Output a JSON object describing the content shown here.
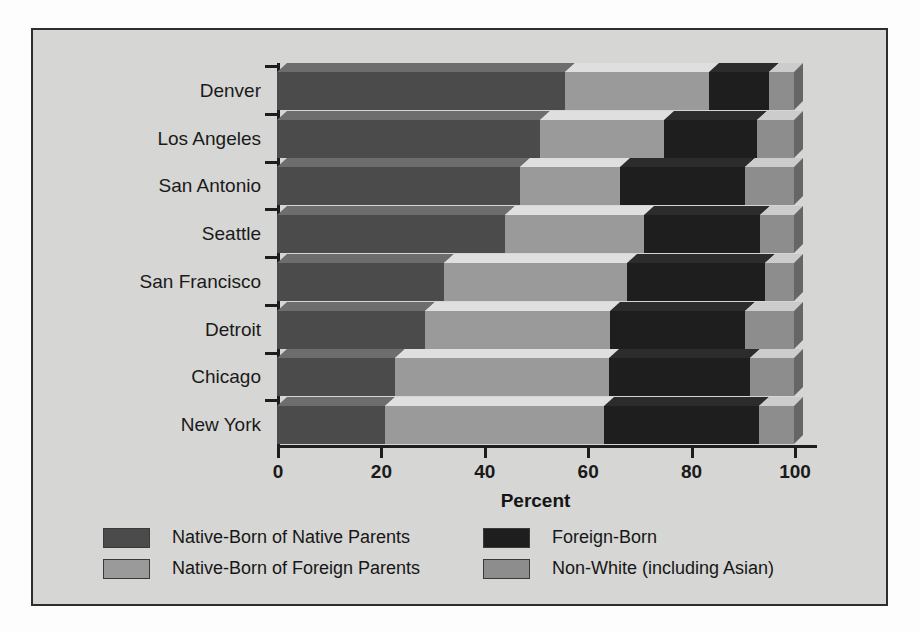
{
  "chart_data": {
    "type": "bar",
    "orientation": "horizontal",
    "stacked": true,
    "title": "",
    "xlabel": "Percent",
    "ylabel": "",
    "xlim": [
      0,
      100
    ],
    "xticks": [
      0,
      20,
      40,
      60,
      80,
      100
    ],
    "xtick_labels": [
      "0",
      "20",
      "40",
      "60",
      "80",
      "100"
    ],
    "grid": false,
    "legend_position": "bottom",
    "categories": [
      "Denver",
      "Los Angeles",
      "San Antonio",
      "Seattle",
      "San Francisco",
      "Detroit",
      "Chicago",
      "New York"
    ],
    "series": [
      {
        "name": "Native-Born of Native Parents",
        "color": "#4b4b4b",
        "values": [
          55.7,
          50.9,
          47.0,
          44.1,
          32.3,
          28.6,
          22.9,
          20.9
        ]
      },
      {
        "name": "Native-Born of Foreign Parents",
        "color": "#9a9a9a",
        "values": [
          27.9,
          23.9,
          19.3,
          26.9,
          35.4,
          35.8,
          41.3,
          42.3
        ]
      },
      {
        "name": "Foreign-Born",
        "color": "#1e1e1e",
        "values": [
          11.6,
          18.0,
          24.2,
          22.4,
          26.7,
          26.1,
          27.3,
          30.0
        ]
      },
      {
        "name": "Non-White (including Asian)",
        "color": "#8d8d8d",
        "values": [
          4.8,
          7.2,
          9.5,
          6.6,
          5.6,
          9.5,
          8.5,
          6.8
        ]
      }
    ]
  },
  "axis": {
    "x_title": "Percent"
  },
  "legend": {
    "items": [
      {
        "label": "Native-Born of Native Parents",
        "color": "#4b4b4b"
      },
      {
        "label": "Foreign-Born",
        "color": "#1e1e1e"
      },
      {
        "label": "Native-Born of Foreign Parents",
        "color": "#9a9a9a"
      },
      {
        "label": "Non-White (including Asian)",
        "color": "#8d8d8d"
      }
    ]
  },
  "style": {
    "panel_background": "#d6d6d4",
    "panel_border": "#2e2e2e",
    "axis_color": "#1d1d1d",
    "text_color": "#1a1a1a"
  }
}
